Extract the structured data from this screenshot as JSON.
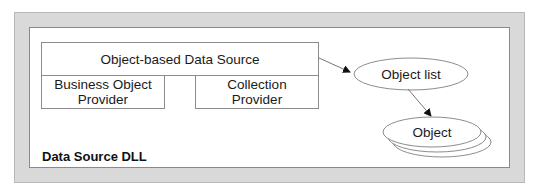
{
  "diagram": {
    "container": {
      "label": "Data Source DLL",
      "frame_color": "#d9d9d9",
      "border_color": "#8a8a8a"
    },
    "main_component": {
      "label": "Object-based Data Source",
      "providers": [
        {
          "label": "Business Object Provider",
          "lines": [
            "Business Object",
            "Provider"
          ]
        },
        {
          "label": "Collection Provider",
          "lines": [
            "Collection",
            "Provider"
          ]
        }
      ]
    },
    "nodes": [
      {
        "id": "object-list",
        "label": "Object list",
        "shape": "ellipse"
      },
      {
        "id": "object",
        "label": "Object",
        "shape": "stacked-ellipse"
      }
    ],
    "edges": [
      {
        "from": "Object-based Data Source",
        "to": "Object list",
        "style": "arrow"
      },
      {
        "from": "Object list",
        "to": "Object",
        "style": "arrow"
      }
    ]
  }
}
